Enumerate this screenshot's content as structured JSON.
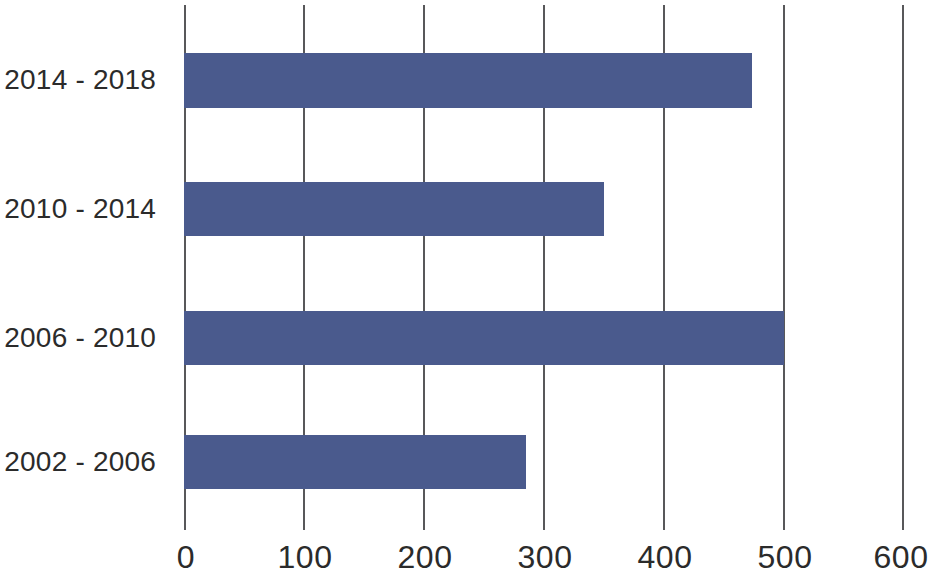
{
  "chart_data": {
    "type": "bar",
    "orientation": "horizontal",
    "title": "",
    "subtitle": "",
    "xlabel": "",
    "ylabel": "",
    "categories": [
      "2002 - 2006",
      "2006 - 2010",
      "2010 - 2014",
      "2014 - 2018"
    ],
    "values": [
      285,
      500,
      350,
      473
    ],
    "series": [
      {
        "name": "",
        "values": [
          285,
          500,
          350,
          473
        ]
      }
    ],
    "bars": [
      {
        "category": "2014 - 2018",
        "value": 473
      },
      {
        "category": "2010 - 2014",
        "value": 350
      },
      {
        "category": "2006 - 2010",
        "value": 500
      },
      {
        "category": "2002 - 2006",
        "value": 285
      }
    ],
    "xlim": [
      0,
      600
    ],
    "ylim": null,
    "xticks": [
      0,
      100,
      200,
      300,
      400,
      500,
      600
    ],
    "xtick_labels": [
      "0",
      "100",
      "200",
      "300",
      "400",
      "500",
      "600"
    ],
    "ytick_labels": [
      "2014 - 2018",
      "2010 - 2014",
      "2006 - 2010",
      "2002 - 2006"
    ],
    "grid": {
      "vertical": true,
      "horizontal": false
    },
    "legend": {
      "visible": false,
      "position": "none",
      "entries": []
    },
    "colors": {
      "bar_fill": "#4a5a8d",
      "gridline": "#58585a",
      "text": "#2b2b2b",
      "background": "#ffffff"
    },
    "annotations": []
  }
}
